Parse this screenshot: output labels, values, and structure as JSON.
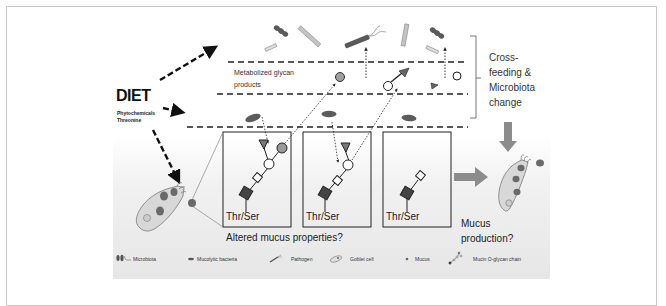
{
  "figure": {
    "diet": {
      "title": "DIET",
      "items": [
        "Phytochemicals",
        "Threonine"
      ]
    },
    "layers": {
      "metabolized_label_line1": "Metabolized glycan",
      "metabolized_label_line2": "products"
    },
    "bracket_label": [
      "Cross-",
      "feeding &",
      "Microbiota",
      "change"
    ],
    "mucin_boxes": [
      {
        "label": "Thr/Ser",
        "chain": "full"
      },
      {
        "label": "Thr/Ser",
        "chain": "partial"
      },
      {
        "label": "Thr/Ser",
        "chain": "minimal"
      }
    ],
    "altered_question": "Altered mucus properties?",
    "mucus_production": [
      "Mucus",
      "production?"
    ],
    "legend": [
      {
        "icon": "microbiota-icon",
        "label": "Microbiota"
      },
      {
        "icon": "mucolytic-bacteria-icon",
        "label": "Mucolytic bacteria"
      },
      {
        "icon": "pathogen-icon",
        "label": "Pathogen"
      },
      {
        "icon": "goblet-cell-icon",
        "label": "Goblet cell"
      },
      {
        "icon": "mucus-icon",
        "label": "Mucus"
      },
      {
        "icon": "mucin-o-glycan-chain-icon",
        "label": "Mucin O-glycan chain"
      }
    ],
    "colors": {
      "dark_grey": "#555555",
      "mid_grey": "#8a8a8a",
      "light_grey": "#bdbdbd",
      "arrow_grey": "#8c8c8c",
      "panel_bg": "#e8e8e8"
    }
  }
}
